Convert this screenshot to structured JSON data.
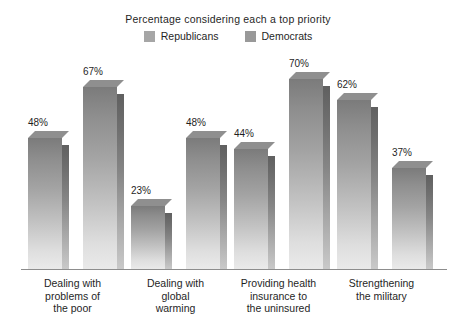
{
  "chart_data": {
    "type": "bar",
    "title": "Percentage considering each a top priority",
    "subtitle": "",
    "xlabel": "",
    "ylabel": "",
    "ylim": [
      0,
      75
    ],
    "grid": false,
    "legend_position": "top-center",
    "value_suffix": "%",
    "categories": [
      "Dealing with problems of the poor",
      "Dealing with global warming",
      "Providing health insurance to the uninsured",
      "Strengthening the military"
    ],
    "category_lines": [
      [
        "Dealing with",
        "problems of",
        "the poor"
      ],
      [
        "Dealing with",
        "global",
        "warming"
      ],
      [
        "Providing health",
        "insurance to",
        "the uninsured"
      ],
      [
        "Strengthening",
        "the military"
      ]
    ],
    "series": [
      {
        "name": "Republicans",
        "color": "#a6a6a6",
        "values": [
          48,
          23,
          44,
          62
        ],
        "labels": [
          "48%",
          "23%",
          "44%",
          "62%"
        ]
      },
      {
        "name": "Democrats",
        "color": "#999999",
        "values": [
          67,
          48,
          70,
          37
        ],
        "labels": [
          "67%",
          "48%",
          "70%",
          "37%"
        ]
      }
    ]
  },
  "legend": {
    "entries": [
      {
        "label": "Republicans",
        "swatch": "#a6a6a6"
      },
      {
        "label": "Democrats",
        "swatch": "#999999"
      }
    ]
  },
  "axis": {
    "baseline_color": "#8d8d8d"
  },
  "bars": [
    {
      "label": "48%",
      "series": "Republicans",
      "category": "Dealing with problems of the poor"
    },
    {
      "label": "67%",
      "series": "Democrats",
      "category": "Dealing with problems of the poor"
    },
    {
      "label": "23%",
      "series": "Republicans",
      "category": "Dealing with global warming"
    },
    {
      "label": "48%",
      "series": "Democrats",
      "category": "Dealing with global warming"
    },
    {
      "label": "44%",
      "series": "Republicans",
      "category": "Providing health insurance to the uninsured"
    },
    {
      "label": "70%",
      "series": "Democrats",
      "category": "Providing health insurance to the uninsured"
    },
    {
      "label": "62%",
      "series": "Republicans",
      "category": "Strengthening the military"
    },
    {
      "label": "37%",
      "series": "Democrats",
      "category": "Strengthening the military"
    }
  ],
  "categories": [
    {
      "line1": "Dealing with",
      "line2": "problems of",
      "line3": "the poor"
    },
    {
      "line1": "Dealing with",
      "line2": "global",
      "line3": "warming"
    },
    {
      "line1": "Providing health",
      "line2": "insurance to",
      "line3": "the uninsured"
    },
    {
      "line1": "Strengthening",
      "line2": "the military",
      "line3": ""
    }
  ]
}
